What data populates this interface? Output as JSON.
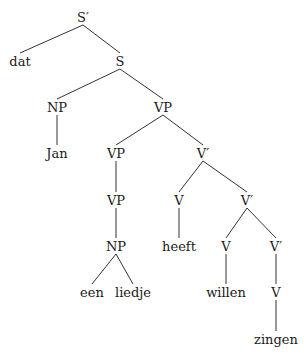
{
  "diagram": {
    "type": "syntax-tree",
    "nodes": [
      {
        "id": "n0",
        "label": "S′",
        "x": 83,
        "y": 17
      },
      {
        "id": "n1",
        "label": "dat",
        "x": 20,
        "y": 61
      },
      {
        "id": "n2",
        "label": "S",
        "x": 120,
        "y": 61
      },
      {
        "id": "n3",
        "label": "NP",
        "x": 57,
        "y": 107
      },
      {
        "id": "n4",
        "label": "VP",
        "x": 163,
        "y": 107
      },
      {
        "id": "n5",
        "label": "Jan",
        "x": 57,
        "y": 153
      },
      {
        "id": "n6",
        "label": "VP",
        "x": 116,
        "y": 153
      },
      {
        "id": "n7",
        "label": "V′",
        "x": 203,
        "y": 153
      },
      {
        "id": "n8",
        "label": "VP",
        "x": 116,
        "y": 200
      },
      {
        "id": "n9",
        "label": "V",
        "x": 179,
        "y": 200
      },
      {
        "id": "n10",
        "label": "V′",
        "x": 247,
        "y": 200
      },
      {
        "id": "n11",
        "label": "NP",
        "x": 116,
        "y": 246
      },
      {
        "id": "n12",
        "label": "heeft",
        "x": 179,
        "y": 246
      },
      {
        "id": "n13",
        "label": "V",
        "x": 226,
        "y": 246
      },
      {
        "id": "n14",
        "label": "V′",
        "x": 276,
        "y": 246
      },
      {
        "id": "n15",
        "label": "een",
        "x": 92,
        "y": 292
      },
      {
        "id": "n16",
        "label": "liedje",
        "x": 133,
        "y": 292
      },
      {
        "id": "n17",
        "label": "willen",
        "x": 226,
        "y": 292
      },
      {
        "id": "n18",
        "label": "V",
        "x": 276,
        "y": 292
      },
      {
        "id": "n19",
        "label": "zingen",
        "x": 276,
        "y": 339
      }
    ],
    "edges": [
      [
        "n0",
        "n1"
      ],
      [
        "n0",
        "n2"
      ],
      [
        "n2",
        "n3"
      ],
      [
        "n2",
        "n4"
      ],
      [
        "n3",
        "n5"
      ],
      [
        "n4",
        "n6"
      ],
      [
        "n4",
        "n7"
      ],
      [
        "n6",
        "n8"
      ],
      [
        "n7",
        "n9"
      ],
      [
        "n7",
        "n10"
      ],
      [
        "n8",
        "n11"
      ],
      [
        "n9",
        "n12"
      ],
      [
        "n10",
        "n13"
      ],
      [
        "n10",
        "n14"
      ],
      [
        "n11",
        "n15"
      ],
      [
        "n11",
        "n16"
      ],
      [
        "n13",
        "n17"
      ],
      [
        "n14",
        "n18"
      ],
      [
        "n18",
        "n19"
      ]
    ]
  }
}
